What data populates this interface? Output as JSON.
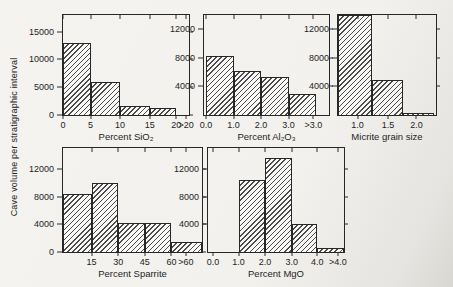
{
  "figure": {
    "y_axis_title": "Cave volume per stratigraphic interval",
    "ink_color": "#272727",
    "background": "#f2f1ee"
  },
  "chart_data": [
    {
      "type": "bar",
      "xlabel": "Percent SiO₂",
      "ylim": [
        0,
        18000
      ],
      "grid": false,
      "categories": [
        "0–5",
        "5–10",
        "10–15",
        "15–20",
        ">20"
      ],
      "values": [
        13000,
        6000,
        1700,
        1200,
        0
      ],
      "y_ticks": [
        {
          "label": "0",
          "frac": 0
        },
        {
          "label": "5000",
          "frac": 0.278
        },
        {
          "label": "10000",
          "frac": 0.556
        },
        {
          "label": "15000",
          "frac": 0.833
        }
      ],
      "x_ticks": [
        {
          "label": "0",
          "frac": 0
        },
        {
          "label": "5",
          "frac": 0.219
        },
        {
          "label": "10",
          "frac": 0.453
        },
        {
          "label": "15",
          "frac": 0.688
        },
        {
          "label": "20",
          "frac": 0.898
        },
        {
          "label": ">20",
          "frac": 0.977
        }
      ],
      "bars": [
        {
          "f0": 0,
          "f1": 0.219,
          "value": 13000
        },
        {
          "f0": 0.219,
          "f1": 0.453,
          "value": 6000
        },
        {
          "f0": 0.453,
          "f1": 0.688,
          "value": 1700
        },
        {
          "f0": 0.688,
          "f1": 0.898,
          "value": 1200
        },
        {
          "f0": 0.898,
          "f1": 1,
          "value": 0
        }
      ]
    },
    {
      "type": "bar",
      "xlabel": "Percent Al₂O₃",
      "ylim": [
        0,
        14000
      ],
      "grid": false,
      "categories": [
        "0.0–1.0",
        "1.0–2.0",
        "2.0–3.0",
        ">3.0"
      ],
      "values": [
        8200,
        6200,
        5300,
        3000
      ],
      "y_ticks": [
        {
          "label": "4000",
          "frac": 0.286
        },
        {
          "label": "8000",
          "frac": 0.571
        },
        {
          "label": "12000",
          "frac": 0.857
        }
      ],
      "x_ticks": [
        {
          "label": "0.0",
          "frac": 0.016
        },
        {
          "label": "1.0",
          "frac": 0.236
        },
        {
          "label": "2.0",
          "frac": 0.457
        },
        {
          "label": "3.0",
          "frac": 0.677
        },
        {
          "label": ">3.0",
          "frac": 0.875
        }
      ],
      "bars": [
        {
          "f0": 0.016,
          "f1": 0.236,
          "value": 8200
        },
        {
          "f0": 0.236,
          "f1": 0.457,
          "value": 6200
        },
        {
          "f0": 0.457,
          "f1": 0.677,
          "value": 5300
        },
        {
          "f0": 0.677,
          "f1": 0.898,
          "value": 3000
        }
      ]
    },
    {
      "type": "bar",
      "xlabel": "Micrite grain size",
      "ylim": [
        0,
        14000
      ],
      "grid": false,
      "categories": [
        "1.0",
        "1.5",
        "2.0"
      ],
      "values": [
        14000,
        4900,
        300
      ],
      "y_ticks": [
        {
          "label": "4000",
          "frac": 0.286
        },
        {
          "label": "8000",
          "frac": 0.571
        },
        {
          "label": "12000",
          "frac": 0.857
        }
      ],
      "x_ticks": [
        {
          "label": "1.0",
          "frac": 0.2
        },
        {
          "label": "1.5",
          "frac": 0.51
        },
        {
          "label": "2.0",
          "frac": 0.8
        }
      ],
      "bars": [
        {
          "f0": 0,
          "f1": 0.35,
          "value": 14000
        },
        {
          "f0": 0.35,
          "f1": 0.66,
          "value": 4900
        },
        {
          "f0": 0.66,
          "f1": 0.98,
          "value": 300
        }
      ]
    },
    {
      "type": "bar",
      "xlabel": "Percent Sparrite",
      "ylim": [
        0,
        15000
      ],
      "grid": false,
      "categories": [
        "0–15",
        "15–30",
        "30–45",
        "45–60",
        ">60"
      ],
      "values": [
        8300,
        10000,
        4200,
        4200,
        1500
      ],
      "y_ticks": [
        {
          "label": "0",
          "frac": 0
        },
        {
          "label": "4000",
          "frac": 0.267
        },
        {
          "label": "8000",
          "frac": 0.533
        },
        {
          "label": "12000",
          "frac": 0.8
        }
      ],
      "x_ticks": [
        {
          "label": "15",
          "frac": 0.206
        },
        {
          "label": "30",
          "frac": 0.397
        },
        {
          "label": "45",
          "frac": 0.589
        },
        {
          "label": "60",
          "frac": 0.78
        },
        {
          "label": ">60",
          "frac": 0.885
        }
      ],
      "bars": [
        {
          "f0": 0,
          "f1": 0.206,
          "value": 8300
        },
        {
          "f0": 0.206,
          "f1": 0.397,
          "value": 10000
        },
        {
          "f0": 0.397,
          "f1": 0.589,
          "value": 4200
        },
        {
          "f0": 0.589,
          "f1": 0.78,
          "value": 4200
        },
        {
          "f0": 0.78,
          "f1": 1,
          "value": 1500
        }
      ]
    },
    {
      "type": "bar",
      "xlabel": "Percent MgO",
      "ylim": [
        0,
        15000
      ],
      "grid": false,
      "categories": [
        "0.0–1.0",
        "1.0–2.0",
        "2.0–3.0",
        "3.0–4.0",
        ">4.0"
      ],
      "values": [
        0,
        10400,
        13500,
        4000,
        600
      ],
      "y_ticks": [
        {
          "label": "4000",
          "frac": 0.267
        },
        {
          "label": "8000",
          "frac": 0.533
        },
        {
          "label": "12000",
          "frac": 0.8
        }
      ],
      "x_ticks": [
        {
          "label": "0.0",
          "frac": 0.036
        },
        {
          "label": "1.0",
          "frac": 0.225
        },
        {
          "label": "2.0",
          "frac": 0.42
        },
        {
          "label": "3.0",
          "frac": 0.616
        },
        {
          "label": "4.0",
          "frac": 0.804
        },
        {
          "label": ">4.0",
          "frac": 0.955
        }
      ],
      "bars": [
        {
          "f0": 0.225,
          "f1": 0.42,
          "value": 10400
        },
        {
          "f0": 0.42,
          "f1": 0.616,
          "value": 13500
        },
        {
          "f0": 0.616,
          "f1": 0.804,
          "value": 4000
        },
        {
          "f0": 0.804,
          "f1": 1,
          "value": 600
        }
      ]
    }
  ]
}
